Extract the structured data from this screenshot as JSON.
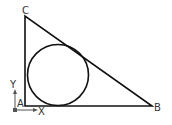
{
  "diagram": {
    "type": "triangle-with-inscribed-circle",
    "vertices": {
      "A": {
        "label": "A"
      },
      "B": {
        "label": "B"
      },
      "C": {
        "label": "C"
      }
    },
    "ucs_icon": {
      "x_label": "X",
      "y_label": "Y"
    },
    "colors": {
      "stroke": "#111111",
      "background": "#ffffff",
      "ucs": "#555555"
    }
  }
}
